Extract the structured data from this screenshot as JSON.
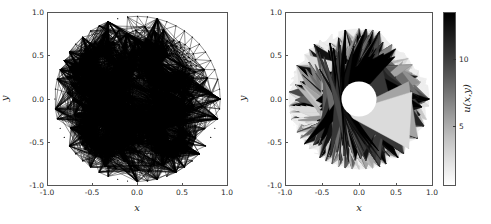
{
  "figure": {
    "width": 491,
    "height": 224,
    "background": "#ffffff",
    "panels": 2
  },
  "chart_data": [
    {
      "type": "mesh",
      "panel_index": 0,
      "title": "",
      "xlabel": "x",
      "ylabel": "y",
      "xlim": [
        -1.0,
        1.0
      ],
      "ylim": [
        -1.0,
        1.0
      ],
      "xticks": [
        -1.0,
        -0.5,
        0.0,
        0.5,
        1.0
      ],
      "yticks": [
        -1.0,
        -0.5,
        0.0,
        0.5,
        1.0
      ],
      "xticklabels": [
        "-1.0",
        "-0.5",
        "0.0",
        "0.5",
        "1.0"
      ],
      "yticklabels": [
        "-1.0",
        "-0.5",
        "0.0",
        "0.5",
        "1.0"
      ],
      "grid": false,
      "legend": null,
      "description": "Unstructured triangular finite-element mesh of an elliptical domain containing five circular holes",
      "domain_boundary": {
        "shape": "ellipse",
        "cx": 0.0,
        "cy": 0.0,
        "rx": 1.0,
        "ry": 1.0
      },
      "holes": [
        {
          "name": "center-hole",
          "cx": 0.0,
          "cy": 0.0,
          "r": 0.25,
          "refined": false
        },
        {
          "name": "hole-upper-left",
          "cx": -0.4,
          "cy": 0.4,
          "r": 0.12,
          "refined": true
        },
        {
          "name": "hole-upper-right",
          "cx": 0.4,
          "cy": 0.4,
          "r": 0.12,
          "refined": true
        },
        {
          "name": "hole-lower-left",
          "cx": -0.4,
          "cy": -0.4,
          "r": 0.12,
          "refined": true
        },
        {
          "name": "hole-lower-right",
          "cx": 0.4,
          "cy": -0.4,
          "r": 0.12,
          "refined": true
        }
      ],
      "mesh_style": {
        "edge_color": "#000000",
        "edge_width": 0.5,
        "vertex_color": "#000000",
        "vertex_size": 1.2
      },
      "approx_vertices": 430,
      "approx_triangles": 760
    },
    {
      "type": "contour",
      "panel_index": 1,
      "title": "",
      "xlabel": "x",
      "ylabel": "y",
      "xlim": [
        -1.0,
        1.0
      ],
      "ylim": [
        -1.0,
        1.0
      ],
      "xticks": [
        -1.0,
        -0.5,
        0.0,
        0.5,
        1.0
      ],
      "yticks": [
        -1.0,
        -0.5,
        0.0,
        0.5,
        1.0
      ],
      "xticklabels": [
        "-1.0",
        "-0.5",
        "0.0",
        "0.5",
        "1.0"
      ],
      "yticklabels": [
        "-1.0",
        "-0.5",
        "0.0",
        "0.5",
        "1.0"
      ],
      "grid": false,
      "legend": null,
      "description": "Filled grayscale contour plot of the solution u(x,y) on the elliptical domain; maximum values form a four-lobed dark ring around the central hole, with light low-value pockets at the four small-hole locations",
      "colormap": "gray_r",
      "colorbar": {
        "label": "u(x,y)",
        "orientation": "vertical",
        "position": "right",
        "vmin": 0,
        "vmax": 13,
        "ticks": [
          5,
          10
        ],
        "ticklabels": [
          "5",
          "10"
        ],
        "low_color": "#ffffff",
        "high_color": "#000000"
      },
      "field_features": [
        {
          "name": "central-hole",
          "cx": 0.0,
          "cy": 0.0,
          "r": 0.25,
          "value": null
        },
        {
          "name": "peak-ring",
          "description": "dark four-lobed high-value band hugging central hole",
          "value_range": [
            10,
            13
          ]
        },
        {
          "name": "lobe-up",
          "cx": 0.0,
          "cy": 0.45,
          "value": 7
        },
        {
          "name": "lobe-down",
          "cx": 0.0,
          "cy": -0.45,
          "value": 7
        },
        {
          "name": "lobe-left",
          "cx": -0.45,
          "cy": 0.0,
          "value": 7
        },
        {
          "name": "lobe-right",
          "cx": 0.45,
          "cy": 0.0,
          "value": 7
        },
        {
          "name": "low-pocket-upper-left",
          "cx": -0.4,
          "cy": 0.4,
          "value": 1
        },
        {
          "name": "low-pocket-upper-right",
          "cx": 0.4,
          "cy": 0.4,
          "value": 1
        },
        {
          "name": "low-pocket-lower-left",
          "cx": -0.4,
          "cy": -0.4,
          "value": 1
        },
        {
          "name": "low-pocket-lower-right",
          "cx": 0.4,
          "cy": -0.4,
          "value": 1
        },
        {
          "name": "outer-rim",
          "value": 0.5
        }
      ]
    }
  ]
}
